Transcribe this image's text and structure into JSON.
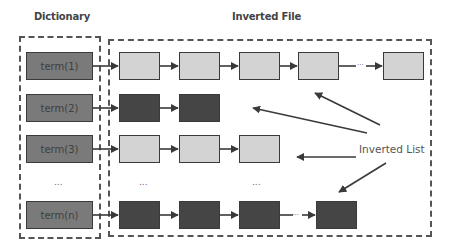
{
  "titles": {
    "dictionary": "Dictionary",
    "inverted_file": "Inverted File"
  },
  "dictionary": {
    "terms": [
      {
        "label": "term(1)"
      },
      {
        "label": "term(2)"
      },
      {
        "label": "term(3)"
      },
      {
        "label": "term(n)"
      }
    ],
    "ellipsis": "..."
  },
  "inverted_file": {
    "posting_lists": [
      {
        "term": "term(1)",
        "shade": "light",
        "visible_nodes": 5,
        "has_gap_ellipsis": true
      },
      {
        "term": "term(2)",
        "shade": "dark",
        "visible_nodes": 2,
        "has_gap_ellipsis": false
      },
      {
        "term": "term(3)",
        "shade": "light",
        "visible_nodes": 3,
        "has_gap_ellipsis": false
      },
      {
        "term": "term(n)",
        "shade": "dark",
        "visible_nodes": 4,
        "has_gap_ellipsis": true
      }
    ],
    "ellipsis": "...",
    "annotation_label": "Inverted List"
  },
  "colors": {
    "term_fill": "#7a7a7a",
    "light_node_fill": "#d3d3d3",
    "dark_node_fill": "#454545",
    "border": "#3a3a3a",
    "arrow": "#3a3a3a"
  }
}
